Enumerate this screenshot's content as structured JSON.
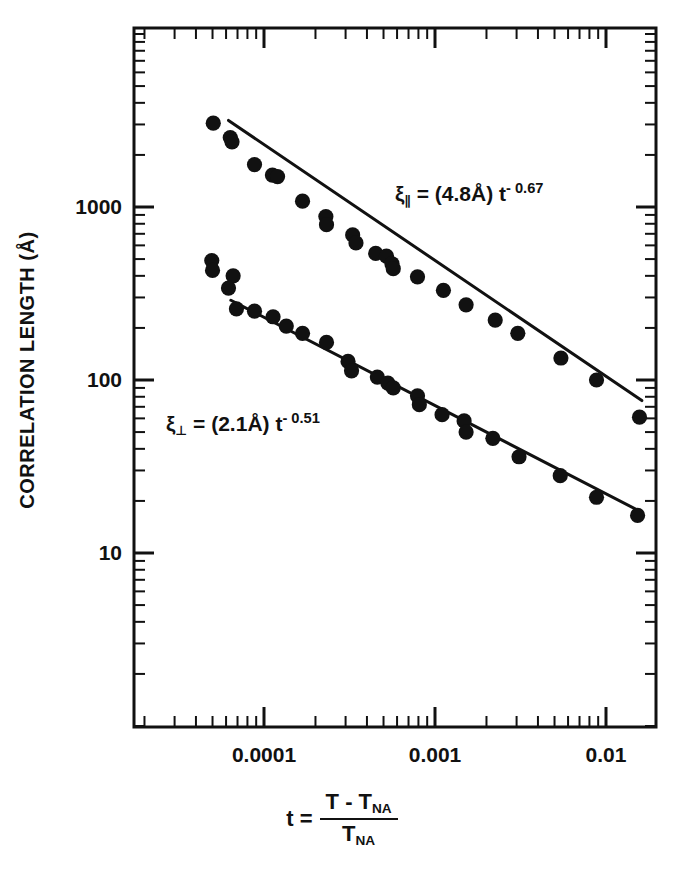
{
  "chart_data": {
    "type": "scatter",
    "title": "",
    "xlabel": "t = (T - T_NA) / T_NA",
    "ylabel": "CORRELATION LENGTH (Å)",
    "xscale": "log",
    "yscale": "log",
    "xlim": [
      4.59e-05,
      0.0182
    ],
    "ylim": [
      3.6,
      6800
    ],
    "grid": false,
    "legend": "none",
    "x_ticks_major": [
      {
        "value": 0.0001,
        "label": "0.0001"
      },
      {
        "value": 0.001,
        "label": "0.001"
      },
      {
        "value": 0.01,
        "label": "0.01"
      }
    ],
    "y_ticks_major": [
      {
        "value": 1000,
        "label": "1000"
      },
      {
        "value": 100,
        "label": "100"
      },
      {
        "value": 10,
        "label": "10"
      }
    ],
    "series": [
      {
        "name": "xi_parallel",
        "marker": "filled-circle",
        "color": "#111111",
        "annotation": "ξ∥ = (4.8Å) t^-0.67",
        "fit": {
          "prefactor": 4.8,
          "exponent": -0.67,
          "units": "Å",
          "x_start": 6.2e-05,
          "x_end": 0.0162
        },
        "points": [
          {
            "x": 5.05e-05,
            "y": 3050
          },
          {
            "x": 6.35e-05,
            "y": 2520
          },
          {
            "x": 6.5e-05,
            "y": 2380
          },
          {
            "x": 8.8e-05,
            "y": 1760
          },
          {
            "x": 0.000112,
            "y": 1530
          },
          {
            "x": 0.00012,
            "y": 1500
          },
          {
            "x": 0.000168,
            "y": 1080
          },
          {
            "x": 0.00023,
            "y": 880
          },
          {
            "x": 0.000232,
            "y": 790
          },
          {
            "x": 0.00033,
            "y": 690
          },
          {
            "x": 0.000345,
            "y": 620
          },
          {
            "x": 0.00045,
            "y": 540
          },
          {
            "x": 0.00052,
            "y": 520
          },
          {
            "x": 0.00056,
            "y": 470
          },
          {
            "x": 0.00057,
            "y": 440
          },
          {
            "x": 0.00079,
            "y": 395
          },
          {
            "x": 0.00112,
            "y": 330
          },
          {
            "x": 0.00152,
            "y": 272
          },
          {
            "x": 0.00225,
            "y": 222
          },
          {
            "x": 0.00305,
            "y": 186
          },
          {
            "x": 0.00545,
            "y": 134
          },
          {
            "x": 0.0088,
            "y": 100
          },
          {
            "x": 0.0157,
            "y": 61
          }
        ]
      },
      {
        "name": "xi_perpendicular",
        "marker": "filled-circle",
        "color": "#111111",
        "annotation": "ξ⊥ = (2.1Å) t^-0.51",
        "fit": {
          "prefactor": 2.1,
          "exponent": -0.51,
          "units": "Å",
          "x_start": 6.4e-05,
          "x_end": 0.0162
        },
        "points": [
          {
            "x": 4.95e-05,
            "y": 490
          },
          {
            "x": 5e-05,
            "y": 430
          },
          {
            "x": 6.6e-05,
            "y": 400
          },
          {
            "x": 6.2e-05,
            "y": 340
          },
          {
            "x": 6.9e-05,
            "y": 258
          },
          {
            "x": 8.8e-05,
            "y": 250
          },
          {
            "x": 0.000113,
            "y": 232
          },
          {
            "x": 0.000135,
            "y": 205
          },
          {
            "x": 0.000168,
            "y": 186
          },
          {
            "x": 0.000232,
            "y": 165
          },
          {
            "x": 0.00031,
            "y": 128
          },
          {
            "x": 0.000325,
            "y": 113
          },
          {
            "x": 0.00046,
            "y": 104
          },
          {
            "x": 0.00053,
            "y": 96
          },
          {
            "x": 0.00057,
            "y": 90
          },
          {
            "x": 0.00079,
            "y": 81
          },
          {
            "x": 0.00081,
            "y": 72
          },
          {
            "x": 0.0011,
            "y": 63
          },
          {
            "x": 0.00148,
            "y": 58
          },
          {
            "x": 0.00152,
            "y": 50
          },
          {
            "x": 0.00218,
            "y": 46
          },
          {
            "x": 0.0031,
            "y": 36
          },
          {
            "x": 0.0054,
            "y": 28
          },
          {
            "x": 0.0088,
            "y": 21
          },
          {
            "x": 0.0153,
            "y": 16.5
          }
        ]
      }
    ]
  },
  "axis_titles": {
    "y": "CORRELATION LENGTH (Å)",
    "x_lhs": "t =",
    "x_numerator": "T - T",
    "x_numerator_sub": "NA",
    "x_denominator": "T",
    "x_denominator_sub": "NA"
  },
  "annotations": {
    "parallel": {
      "symbol": "ξ",
      "subscript": "∥",
      "equals": " = (4.8Å) t",
      "exponent": "- 0.67"
    },
    "perpendicular": {
      "symbol": "ξ",
      "subscript": "⊥",
      "equals": " = (2.1Å) t",
      "exponent": "- 0.51"
    }
  },
  "tick_labels": {
    "y": [
      "1000",
      "100",
      "10"
    ],
    "x": [
      "0.0001",
      "0.001",
      "0.01"
    ]
  },
  "style": {
    "axis_color": "#111111",
    "marker_color": "#111111",
    "background": "#ffffff"
  }
}
